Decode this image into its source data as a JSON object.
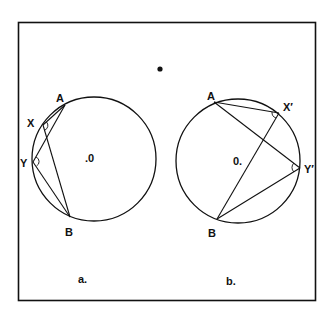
{
  "diagram": {
    "type": "geometry-inscribed-angles",
    "frame": {
      "x": 18,
      "y": 22,
      "w": 298,
      "h": 279
    },
    "stray_dot": {
      "x": 160,
      "y": 69
    },
    "panels": [
      {
        "id": "a",
        "caption": "a.",
        "caption_pos": {
          "x": 82,
          "y": 282
        },
        "circle": {
          "cx": 94,
          "cy": 159,
          "r": 62
        },
        "center_label": ".0",
        "center_label_pos": {
          "x": 86,
          "y": 162
        },
        "points": {
          "A": {
            "x": 65,
            "y": 105,
            "label": "A",
            "lx": 56,
            "ly": 102
          },
          "X": {
            "x": 43,
            "y": 125,
            "label": "X",
            "lx": 28,
            "ly": 126
          },
          "Y": {
            "x": 33,
            "y": 162,
            "label": "Y",
            "lx": 20,
            "ly": 166
          },
          "B": {
            "x": 70,
            "y": 217,
            "label": "B",
            "lx": 65,
            "ly": 235
          }
        },
        "chords": [
          [
            "A",
            "X"
          ],
          [
            "X",
            "B"
          ],
          [
            "A",
            "Y"
          ],
          [
            "Y",
            "B"
          ]
        ],
        "angle_marks": [
          "X",
          "Y"
        ]
      },
      {
        "id": "b",
        "caption": "b.",
        "caption_pos": {
          "x": 225,
          "y": 284
        },
        "circle": {
          "cx": 238,
          "cy": 161,
          "r": 62
        },
        "center_label": "0.",
        "center_label_pos": {
          "x": 234,
          "y": 165
        },
        "points": {
          "A": {
            "x": 214,
            "y": 102,
            "label": "A",
            "lx": 207,
            "ly": 99
          },
          "X": {
            "x": 279,
            "y": 113,
            "label": "X′",
            "lx": 283,
            "ly": 110
          },
          "Y": {
            "x": 300,
            "y": 168,
            "label": "Y′",
            "lx": 304,
            "ly": 172
          },
          "B": {
            "x": 217,
            "y": 219,
            "label": "B",
            "lx": 209,
            "ly": 236
          }
        },
        "chords": [
          [
            "A",
            "X"
          ],
          [
            "X",
            "B"
          ],
          [
            "A",
            "Y"
          ],
          [
            "Y",
            "B"
          ]
        ],
        "angle_marks": [
          "X",
          "Y"
        ]
      }
    ]
  },
  "labels": {
    "a_A": "A",
    "a_X": "X",
    "a_Y": "Y",
    "a_B": "B",
    "a_center": ".0",
    "a_caption": "a.",
    "b_A": "A",
    "b_X": "X′",
    "b_Y": "Y′",
    "b_B": "B",
    "b_center": "0.",
    "b_caption": "b."
  }
}
